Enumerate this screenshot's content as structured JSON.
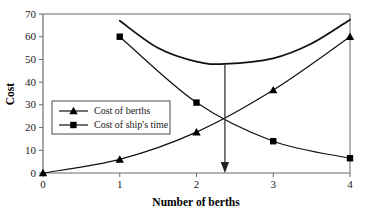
{
  "chart_data": {
    "type": "line",
    "title": "",
    "xlabel": "Number of berths",
    "ylabel": "Cost",
    "xlim": [
      0,
      4
    ],
    "ylim": [
      0,
      70
    ],
    "xticks": [
      "0",
      "1",
      "2",
      "3",
      "4"
    ],
    "yticks": [
      "0",
      "10",
      "20",
      "30",
      "40",
      "50",
      "60",
      "70"
    ],
    "grid": false,
    "legend_position": "inside-left",
    "series": [
      {
        "name": "Cost of berths",
        "marker": "triangle",
        "x": [
          0,
          1,
          2,
          3,
          4
        ],
        "values": [
          0,
          6,
          18,
          36.5,
          60
        ]
      },
      {
        "name": "Cost of ship's time",
        "marker": "square",
        "x": [
          1,
          2,
          3,
          4
        ],
        "values": [
          60,
          31,
          14,
          6.5
        ]
      },
      {
        "name": "Total cost",
        "marker": "none",
        "x": [
          1,
          1.5,
          2,
          2.37,
          3,
          3.5,
          4
        ],
        "values": [
          67,
          55,
          49,
          48,
          50.5,
          57,
          67.5
        ]
      }
    ],
    "annotations": [
      {
        "type": "arrow",
        "label": "optimum-number-of-berths",
        "x": 2.37,
        "y_from": 48,
        "y_to": 0
      }
    ],
    "colors": {
      "line": "#111111",
      "axis": "#555555",
      "marker": "#000000",
      "background": "#ffffff"
    }
  },
  "axes": {
    "y_label": "Cost",
    "x_label": "Number of berths"
  },
  "legend": {
    "entries": [
      {
        "label": "Cost of berths",
        "marker": "triangle"
      },
      {
        "label": "Cost of ship's time",
        "marker": "square"
      }
    ]
  }
}
